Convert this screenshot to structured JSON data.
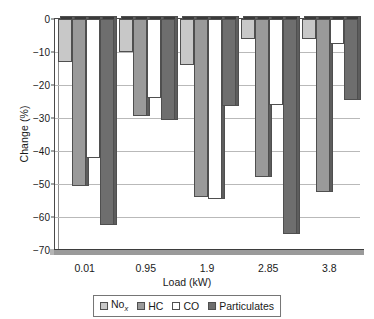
{
  "chart_data": {
    "type": "bar",
    "title": "",
    "xlabel": "Load (kW)",
    "ylabel": "Change (%)",
    "categories": [
      "0.01",
      "0.95",
      "1.9",
      "2.85",
      "3.8"
    ],
    "series": [
      {
        "name": "NOx",
        "label_html": "No<sub>x</sub>",
        "color": "#c8c8c8",
        "values": [
          -13,
          -10,
          -14,
          -6,
          -6
        ]
      },
      {
        "name": "HC",
        "label_html": "HC",
        "color": "#9a9a9a",
        "values": [
          -50.5,
          -29.5,
          -54,
          -48,
          -52.5
        ]
      },
      {
        "name": "CO",
        "label_html": "CO",
        "color": "#ffffff",
        "values": [
          -42,
          -24,
          -54.5,
          -26,
          -7.5
        ]
      },
      {
        "name": "Particulates",
        "label_html": "Particulates",
        "color": "#6e6e6e",
        "values": [
          -62.5,
          -30.5,
          -26.5,
          -65,
          -24.5
        ]
      }
    ],
    "ylim": [
      -70,
      0
    ],
    "ytick_values": [
      0,
      -10,
      -20,
      -30,
      -40,
      -50,
      -60,
      -70
    ],
    "ytick_labels": [
      "0",
      "−10",
      "−20",
      "−30",
      "−40",
      "−50",
      "−60",
      "−70"
    ],
    "grid": true,
    "legend_position": "bottom",
    "legend_entries": [
      "No_x",
      "HC",
      "CO",
      "Particulates"
    ],
    "axis_color": "#4a4a4a",
    "grid_color": "#b9b9b9",
    "background_color": "#ffffff"
  }
}
